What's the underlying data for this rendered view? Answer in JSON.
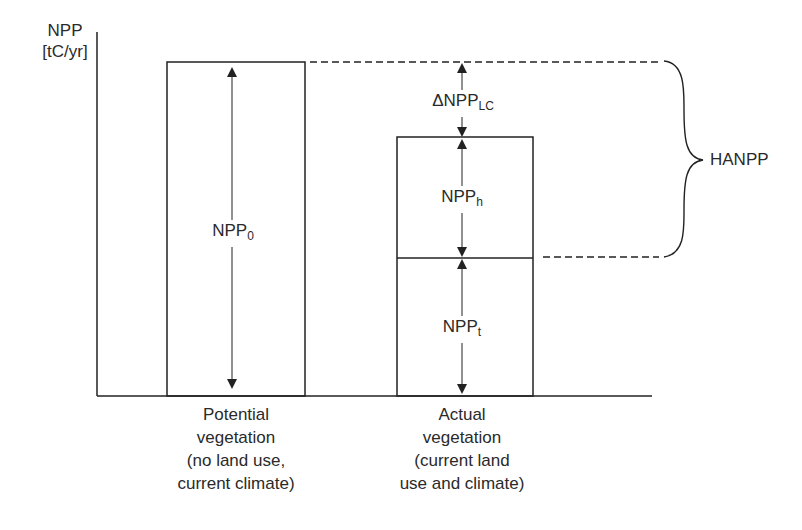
{
  "y_axis": {
    "label_line1": "NPP",
    "label_line2": "[tC/yr]"
  },
  "bars": [
    {
      "name": "potential",
      "caption": [
        "Potential",
        "vegetation",
        "(no land use,",
        "current climate)"
      ],
      "segments": [
        {
          "label": "NPP",
          "sub": "0"
        }
      ]
    },
    {
      "name": "actual",
      "caption": [
        "Actual",
        "vegetation",
        "(current land",
        "use and climate)"
      ],
      "segments": [
        {
          "label": "NPP",
          "sub": "h"
        },
        {
          "label": "NPP",
          "sub": "t"
        }
      ]
    }
  ],
  "delta": {
    "prefix": "Δ",
    "label": "NPP",
    "sub": "LC"
  },
  "brace_label": "HANPP",
  "colors": {
    "line": "#222222",
    "text": "#2a2a2a",
    "background": "#ffffff"
  }
}
